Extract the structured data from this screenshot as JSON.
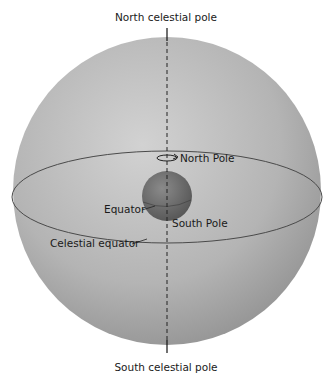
{
  "diagram": {
    "labels": {
      "north_celestial_pole": "North celestial pole",
      "south_celestial_pole": "South celestial pole",
      "north_pole": "North Pole",
      "south_pole": "South Pole",
      "equator": "Equator",
      "celestial_equator": "Celestial equator"
    },
    "colors": {
      "sphere_light": "#c9c9c9",
      "sphere_dark": "#8f8f8f",
      "earth": "#6e6e6e",
      "line": "#333333"
    }
  }
}
